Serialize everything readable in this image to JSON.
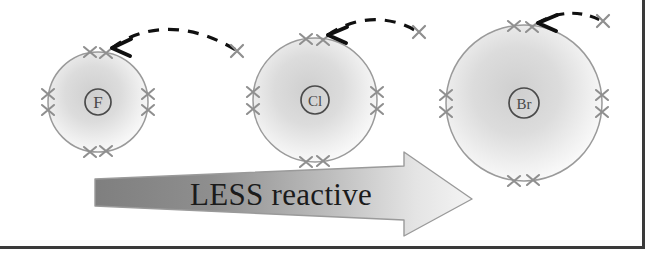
{
  "figure": {
    "kind": "diagram",
    "topic": "Halogen group reactivity trend",
    "atoms": [
      {
        "symbol": "F",
        "name": "fluorine",
        "shell_radius_px": 50,
        "center": [
          98,
          102
        ],
        "electron_pairs": 4,
        "incoming_electron_mark": "×",
        "arrow_style": "dashed-curved"
      },
      {
        "symbol": "Cl",
        "name": "chlorine",
        "shell_radius_px": 62,
        "center": [
          315,
          100
        ],
        "electron_pairs": 4,
        "incoming_electron_mark": "×",
        "arrow_style": "dashed-curved"
      },
      {
        "symbol": "Br",
        "name": "bromine",
        "shell_radius_px": 78,
        "center": [
          524,
          103
        ],
        "electron_pairs": 4,
        "incoming_electron_mark": "×",
        "arrow_style": "dashed-curved"
      }
    ],
    "trend_arrow": {
      "label": "LESS reactive",
      "direction": "left-to-right",
      "fill_start_color": "#8a8a8a",
      "fill_end_color": "#f2f2f2",
      "outline_color": "#9a9a9a",
      "label_color": "#1b1b1b"
    },
    "colors": {
      "shell_outline": "#9a9a9a",
      "shell_fill_center": "#d6d6d6",
      "shell_fill_edge": "#fbfbfb",
      "electron_mark": "#8f8f8f",
      "nucleus_outline": "#4a4a4a",
      "nucleus_text": "#4a4a4a",
      "dash_arrow": "#101010",
      "frame": "#3a3a3a",
      "background": "#ffffff"
    },
    "frame": {
      "right_border": true,
      "bottom_border": true,
      "left_border": false,
      "top_border": false
    }
  }
}
